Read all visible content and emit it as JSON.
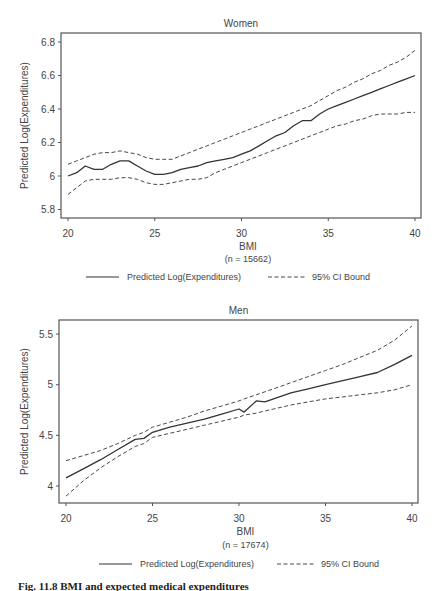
{
  "chart_data": [
    {
      "type": "line",
      "title": "Women",
      "xlabel": "BMI",
      "xsublabel": "(n = 15662)",
      "ylabel": "Predicted Log(Expenditures)",
      "xlim": [
        20,
        40
      ],
      "ylim": [
        5.76,
        6.84
      ],
      "xticks": [
        "20",
        "25",
        "30",
        "35",
        "40"
      ],
      "yticks": [
        "5.8",
        "6",
        "6.2",
        "6.4",
        "6.6",
        "6.8"
      ],
      "grid": false,
      "legend_position": "bottom",
      "x": [
        20,
        20.5,
        21,
        21.5,
        22,
        22.5,
        23,
        23.5,
        24,
        24.5,
        25,
        25.5,
        26,
        26.5,
        27,
        27.5,
        28,
        28.5,
        29,
        29.5,
        30,
        30.5,
        31,
        31.5,
        32,
        32.5,
        33,
        33.5,
        34,
        34.5,
        35,
        35.5,
        36,
        36.5,
        37,
        37.5,
        38,
        38.5,
        39,
        39.5,
        40
      ],
      "series": [
        {
          "name": "Predicted Log(Expenditures)",
          "style": "solid",
          "values": [
            6.0,
            6.02,
            6.06,
            6.04,
            6.04,
            6.07,
            6.09,
            6.09,
            6.06,
            6.03,
            6.01,
            6.01,
            6.02,
            6.04,
            6.05,
            6.06,
            6.08,
            6.09,
            6.1,
            6.11,
            6.13,
            6.15,
            6.18,
            6.21,
            6.24,
            6.26,
            6.3,
            6.33,
            6.33,
            6.37,
            6.4,
            6.42,
            6.44,
            6.46,
            6.48,
            6.5,
            6.52,
            6.54,
            6.56,
            6.58,
            6.6
          ]
        },
        {
          "name": "95% CI Bound (upper)",
          "style": "dashed",
          "values": [
            6.07,
            6.09,
            6.11,
            6.13,
            6.14,
            6.14,
            6.15,
            6.14,
            6.13,
            6.11,
            6.1,
            6.1,
            6.1,
            6.12,
            6.14,
            6.16,
            6.18,
            6.2,
            6.22,
            6.24,
            6.26,
            6.28,
            6.3,
            6.32,
            6.34,
            6.36,
            6.38,
            6.4,
            6.42,
            6.45,
            6.48,
            6.51,
            6.53,
            6.56,
            6.58,
            6.61,
            6.63,
            6.66,
            6.68,
            6.71,
            6.75
          ]
        },
        {
          "name": "95% CI Bound (lower)",
          "style": "dashed",
          "values": [
            5.89,
            5.93,
            5.97,
            5.98,
            5.98,
            5.98,
            5.99,
            5.99,
            5.98,
            5.96,
            5.95,
            5.95,
            5.96,
            5.97,
            5.98,
            5.98,
            5.99,
            6.02,
            6.04,
            6.06,
            6.08,
            6.1,
            6.12,
            6.14,
            6.16,
            6.18,
            6.2,
            6.22,
            6.24,
            6.26,
            6.28,
            6.3,
            6.31,
            6.33,
            6.34,
            6.36,
            6.37,
            6.37,
            6.37,
            6.38,
            6.38
          ]
        }
      ]
    },
    {
      "type": "line",
      "title": "Men",
      "xlabel": "BMI",
      "xsublabel": "(n = 17674)",
      "ylabel": "Predicted Log(Expenditures)",
      "xlim": [
        20,
        40
      ],
      "ylim": [
        3.82,
        5.64
      ],
      "xticks": [
        "20",
        "25",
        "30",
        "35",
        "40"
      ],
      "yticks": [
        "4",
        "4.5",
        "5",
        "5.5"
      ],
      "grid": false,
      "legend_position": "bottom",
      "x": [
        20,
        21,
        22,
        23,
        24,
        24.5,
        25,
        26,
        27,
        28,
        29,
        30,
        30.3,
        31,
        31.5,
        32,
        33,
        34,
        35,
        36,
        37,
        38,
        39,
        40
      ],
      "series": [
        {
          "name": "Predicted Log(Expenditures)",
          "style": "solid",
          "values": [
            4.08,
            4.17,
            4.26,
            4.36,
            4.46,
            4.47,
            4.53,
            4.58,
            4.62,
            4.66,
            4.71,
            4.76,
            4.73,
            4.84,
            4.83,
            4.86,
            4.92,
            4.96,
            5.0,
            5.04,
            5.08,
            5.12,
            5.2,
            5.29
          ]
        },
        {
          "name": "95% CI Bound (upper)",
          "style": "dashed",
          "values": [
            4.25,
            4.3,
            4.35,
            4.42,
            4.5,
            4.53,
            4.58,
            4.63,
            4.68,
            4.74,
            4.79,
            4.84,
            4.86,
            4.9,
            4.93,
            4.96,
            5.02,
            5.08,
            5.14,
            5.2,
            5.27,
            5.34,
            5.44,
            5.58
          ]
        },
        {
          "name": "95% CI Bound (lower)",
          "style": "dashed",
          "values": [
            3.9,
            4.05,
            4.18,
            4.29,
            4.39,
            4.42,
            4.48,
            4.52,
            4.56,
            4.6,
            4.64,
            4.68,
            4.7,
            4.72,
            4.74,
            4.76,
            4.8,
            4.83,
            4.86,
            4.88,
            4.9,
            4.92,
            4.95,
            5.0
          ]
        }
      ]
    }
  ],
  "legend": {
    "solid_label": "Predicted Log(Expenditures)",
    "dashed_label": "95% CI Bound"
  },
  "caption": "Fig. 11.8   BMI and expected medical expenditures",
  "colors": {
    "axis": "#555555",
    "line": "#333333",
    "text": "#444444"
  }
}
